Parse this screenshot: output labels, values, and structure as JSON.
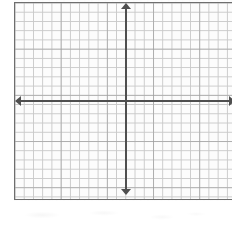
{
  "worksheet": {
    "width": 232,
    "height": 235,
    "background_color": "#ffffff",
    "sheet_color": "#fdfdfd"
  },
  "graph": {
    "panel": {
      "left": 14,
      "top": 2,
      "width": 218,
      "height": 198,
      "border_color": "#6e6e6e",
      "fill_color": "#fcfcfc",
      "clipped_right_edge": true
    },
    "grid": {
      "cell_size_px": 9.24,
      "minor_line_color": "#c9c9c9",
      "major_line_color": "#969696",
      "major_every_cells": 5,
      "columns": 23,
      "rows": 21,
      "visible": true,
      "labels_shown": false,
      "tick_labels_shown": false
    },
    "axes": {
      "color": "#4f4f4f",
      "stroke_width": 2,
      "x_axis": {
        "name": "x-axis",
        "orientation": "horizontal",
        "position_y_px": 98,
        "start_x_px": 0,
        "end_x_px": 218,
        "arrow_left": true,
        "arrow_right": true,
        "label": ""
      },
      "y_axis": {
        "name": "y-axis",
        "orientation": "vertical",
        "position_x_px": 111,
        "start_y_px": 0,
        "end_y_px": 192,
        "arrow_up": true,
        "arrow_down": true,
        "label": ""
      },
      "origin": {
        "x_px": 111,
        "y_px": 98,
        "label": "",
        "marked": false
      }
    },
    "plotted_data": {
      "points": [],
      "lines": [],
      "curves": [],
      "shaded_regions": []
    }
  },
  "answer_area": {
    "name": "blank-answer-area",
    "top": 201,
    "height": 34,
    "background_color": "#ffffff",
    "text": ""
  },
  "chart_data": {
    "type": "scatter",
    "title": "",
    "subtitle": "",
    "xlabel": "",
    "ylabel": "",
    "xlim": [
      -12,
      11
    ],
    "ylim": [
      -10,
      10
    ],
    "xticks": [],
    "yticks": [],
    "grid": true,
    "legend": null,
    "annotations": [],
    "series": [
      {
        "name": "empty",
        "x": [],
        "y": []
      }
    ]
  }
}
